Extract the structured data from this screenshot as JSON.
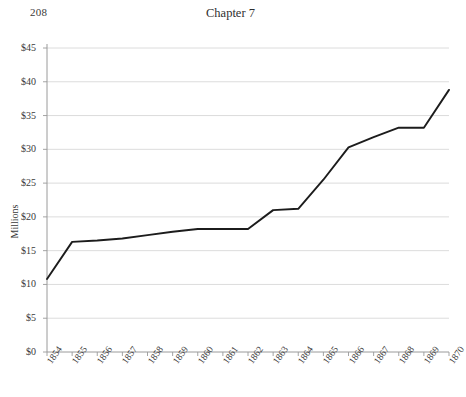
{
  "page": {
    "folio": "208",
    "chapter_title": "Chapter 7"
  },
  "chart_data": {
    "type": "line",
    "title": "",
    "xlabel": "",
    "ylabel": "Millions",
    "categories": [
      "1854",
      "1855",
      "1856",
      "1857",
      "1858",
      "1859",
      "1860",
      "1861",
      "1862",
      "1863",
      "1864",
      "1865",
      "1866",
      "1867",
      "1868",
      "1869",
      "1870"
    ],
    "values": [
      10.8,
      16.3,
      16.5,
      16.8,
      17.3,
      17.8,
      18.2,
      18.2,
      18.2,
      21.0,
      21.2,
      25.5,
      30.3,
      31.8,
      33.2,
      33.2,
      38.8
    ],
    "ylim": [
      0,
      45
    ],
    "ytick_values": [
      0,
      5,
      10,
      15,
      20,
      25,
      30,
      35,
      40,
      45
    ],
    "ytick_labels": [
      "$0",
      "$5",
      "$10",
      "$15",
      "$20",
      "$25",
      "$30",
      "$35",
      "$40",
      "$45"
    ],
    "grid": true,
    "legend": false,
    "line_color": "#1c1c1c",
    "grid_color": "#d8d8d8",
    "axis_color": "#9a9a9a"
  }
}
